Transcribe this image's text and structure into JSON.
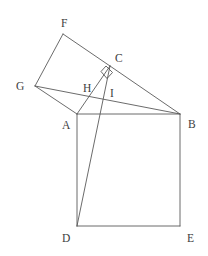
{
  "figure": {
    "background_color": "#ffffff",
    "stroke_color": "#5a5a5a",
    "label_color": "#3d3d3d",
    "canvas": {
      "width": 208,
      "height": 256
    }
  },
  "points": {
    "A": {
      "label": "A",
      "x": 77,
      "y": 114,
      "label_x": 62,
      "label_y": 119
    },
    "B": {
      "label": "B",
      "x": 180,
      "y": 114,
      "label_x": 188,
      "label_y": 118
    },
    "C": {
      "label": "C",
      "x": 110,
      "y": 66,
      "label_x": 115,
      "label_y": 52
    },
    "D": {
      "label": "D",
      "x": 77,
      "y": 226,
      "label_x": 62,
      "label_y": 232
    },
    "E": {
      "label": "E",
      "x": 180,
      "y": 226,
      "label_x": 187,
      "label_y": 232
    },
    "F": {
      "label": "F",
      "x": 63,
      "y": 34,
      "label_x": 61,
      "label_y": 17
    },
    "G": {
      "label": "G",
      "x": 35,
      "y": 86,
      "label_x": 16,
      "label_y": 80
    },
    "H": {
      "label": "H",
      "x": 92,
      "y": 93,
      "label_x": 83,
      "label_y": 82
    },
    "I": {
      "label": "I",
      "x": 108,
      "y": 98,
      "label_x": 110,
      "label_y": 87
    }
  },
  "segments": [
    {
      "name": "segment-A-B",
      "from": "A",
      "to": "B"
    },
    {
      "name": "segment-A-D",
      "from": "A",
      "to": "D"
    },
    {
      "name": "segment-D-E",
      "from": "D",
      "to": "E"
    },
    {
      "name": "segment-B-E",
      "from": "B",
      "to": "E"
    },
    {
      "name": "segment-A-G",
      "from": "A",
      "to": "G"
    },
    {
      "name": "segment-G-F",
      "from": "G",
      "to": "F"
    },
    {
      "name": "segment-F-C",
      "from": "F",
      "to": "C"
    },
    {
      "name": "segment-C-A",
      "from": "C",
      "to": "A"
    },
    {
      "name": "segment-G-B",
      "from": "G",
      "to": "B"
    },
    {
      "name": "segment-C-B",
      "from": "C",
      "to": "B"
    },
    {
      "name": "segment-C-D",
      "from": "C",
      "to": "D"
    }
  ],
  "right_angle_marker": {
    "name": "right-angle-at-C",
    "at": "C",
    "points": "106,66 112.5,72.5 107,78.5 101,71.5"
  },
  "labels_order": [
    "F",
    "C",
    "G",
    "H",
    "I",
    "A",
    "B",
    "D",
    "E"
  ]
}
